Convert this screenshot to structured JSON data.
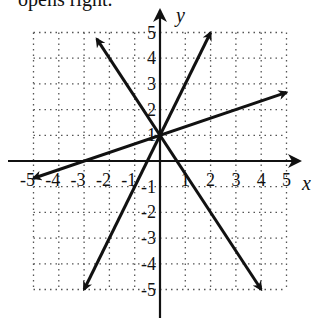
{
  "header_fragment": "opens right.",
  "chart_data": {
    "type": "line",
    "title": "",
    "xlabel": "x",
    "ylabel": "y",
    "xlim": [
      -5,
      5
    ],
    "ylim": [
      -5,
      5
    ],
    "grid": true,
    "grid_style": "dotted",
    "x_ticks": [
      "-5",
      "-4",
      "-3",
      "-2",
      "-1",
      "1",
      "2",
      "3",
      "4",
      "5"
    ],
    "y_ticks": [
      "5",
      "4",
      "3",
      "2",
      "1",
      "-1",
      "-2",
      "-3",
      "-4",
      "-5"
    ],
    "common_point": [
      0,
      1
    ],
    "series": [
      {
        "name": "y = 2x + 1",
        "slope": 2,
        "intercept": 1,
        "x": [
          -3,
          2
        ],
        "y": [
          -5,
          5
        ]
      },
      {
        "name": "y = -1.5x + 1",
        "slope": -1.5,
        "intercept": 1,
        "x": [
          -2.5,
          4
        ],
        "y": [
          4.75,
          -5
        ]
      },
      {
        "name": "y = (1/3)x + 1",
        "slope": 0.3333,
        "intercept": 1,
        "x": [
          -5,
          5
        ],
        "y": [
          -0.67,
          2.67
        ]
      }
    ],
    "arrows_both_ends": true
  }
}
